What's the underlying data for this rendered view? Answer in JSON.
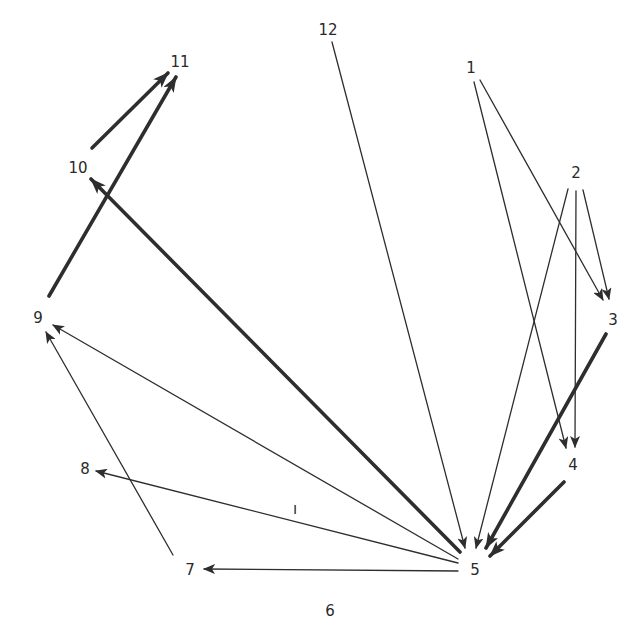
{
  "diagram": {
    "type": "directed-graph",
    "layout": "circular",
    "background": "#ffffff",
    "stroke_color": "#2e2e2e",
    "nodes": [
      {
        "id": "1",
        "label": "1",
        "x": 471,
        "y": 68
      },
      {
        "id": "2",
        "label": "2",
        "x": 576,
        "y": 173
      },
      {
        "id": "3",
        "label": "3",
        "x": 613,
        "y": 320
      },
      {
        "id": "4",
        "label": "4",
        "x": 573,
        "y": 465
      },
      {
        "id": "5",
        "label": "5",
        "x": 475,
        "y": 570
      },
      {
        "id": "6",
        "label": "6",
        "x": 330,
        "y": 611
      },
      {
        "id": "7",
        "label": "7",
        "x": 190,
        "y": 570
      },
      {
        "id": "8",
        "label": "8",
        "x": 85,
        "y": 469
      },
      {
        "id": "9",
        "label": "9",
        "x": 38,
        "y": 318
      },
      {
        "id": "10",
        "label": "10",
        "x": 78,
        "y": 168
      },
      {
        "id": "11",
        "label": "11",
        "x": 180,
        "y": 62
      },
      {
        "id": "12",
        "label": "12",
        "x": 328,
        "y": 30
      }
    ],
    "edges": [
      {
        "from": "1",
        "to": "4",
        "weight": "thin",
        "x1": 474,
        "y1": 82,
        "x2": 566,
        "y2": 448
      },
      {
        "from": "1",
        "to": "3",
        "weight": "thin",
        "x1": 480,
        "y1": 80,
        "x2": 603,
        "y2": 300
      },
      {
        "from": "2",
        "to": "5",
        "weight": "thin",
        "x1": 568,
        "y1": 189,
        "x2": 476,
        "y2": 548
      },
      {
        "from": "2",
        "to": "4",
        "weight": "thin",
        "x1": 576,
        "y1": 191,
        "x2": 575,
        "y2": 447
      },
      {
        "from": "2",
        "to": "3",
        "weight": "thin",
        "x1": 583,
        "y1": 190,
        "x2": 609,
        "y2": 299
      },
      {
        "from": "3",
        "to": "5",
        "weight": "thick",
        "x1": 606,
        "y1": 334,
        "x2": 486,
        "y2": 548
      },
      {
        "from": "4",
        "to": "5",
        "weight": "thick",
        "x1": 564,
        "y1": 482,
        "x2": 490,
        "y2": 556
      },
      {
        "from": "12",
        "to": "5",
        "weight": "thin",
        "x1": 332,
        "y1": 42,
        "x2": 465,
        "y2": 548
      },
      {
        "from": "5",
        "to": "10",
        "weight": "thick",
        "x1": 460,
        "y1": 552,
        "x2": 91,
        "y2": 179
      },
      {
        "from": "5",
        "to": "9",
        "weight": "thin",
        "x1": 458,
        "y1": 559,
        "x2": 53,
        "y2": 325
      },
      {
        "from": "5",
        "to": "8",
        "weight": "thin",
        "x1": 458,
        "y1": 563,
        "x2": 96,
        "y2": 471
      },
      {
        "from": "5",
        "to": "7",
        "weight": "thin",
        "x1": 458,
        "y1": 571,
        "x2": 204,
        "y2": 569
      },
      {
        "from": "7",
        "to": "9",
        "weight": "thin",
        "x1": 173,
        "y1": 555,
        "x2": 46,
        "y2": 332
      },
      {
        "from": "9",
        "to": "11",
        "weight": "thick",
        "x1": 49,
        "y1": 296,
        "x2": 176,
        "y2": 77
      },
      {
        "from": "10",
        "to": "11",
        "weight": "thick",
        "x1": 92,
        "y1": 148,
        "x2": 168,
        "y2": 73
      }
    ],
    "annotations": [
      {
        "text": "ı",
        "x": 295,
        "y": 514
      }
    ]
  }
}
